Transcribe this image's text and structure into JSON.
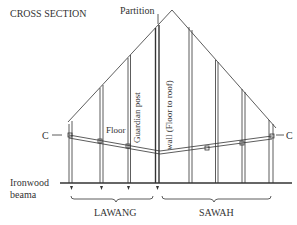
{
  "title": "CROSS SECTION",
  "labels": {
    "partition": "Partition",
    "c_left": "C",
    "c_right": "C",
    "floor": "Floor",
    "guardian_post": "Guardian post",
    "wall": "wall (Floor to roof)",
    "ironwood_line1": "Ironwood",
    "ironwood_line2": "beama",
    "lawang": "LAWANG",
    "sawah": "SAWAH"
  },
  "colors": {
    "line": "#333333",
    "text": "#333333",
    "background": "#ffffff"
  }
}
